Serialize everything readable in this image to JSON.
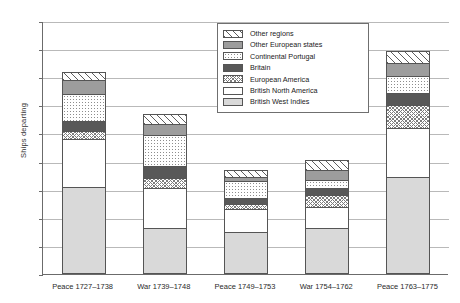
{
  "chart_data": {
    "type": "bar",
    "title": "",
    "subtitle": "",
    "xlabel": "",
    "ylabel": "Ships departing",
    "ylim": [
      0,
      180
    ],
    "ytick_step": 20,
    "yticks": [
      0,
      20,
      40,
      60,
      80,
      100,
      120,
      140,
      160,
      180
    ],
    "grid": true,
    "stacked": true,
    "legend_position": "top-center",
    "categories": [
      "Peace 1727–1738",
      "War 1739–1748",
      "Peace 1749–1753",
      "War 1754–1762",
      "Peace 1763–1775"
    ],
    "series": [
      {
        "name": "British West Indies",
        "values": [
          62,
          33,
          30,
          33,
          69
        ]
      },
      {
        "name": "British North America",
        "values": [
          34,
          28,
          16,
          15,
          35
        ]
      },
      {
        "name": "European America",
        "values": [
          6,
          7,
          4,
          8,
          16
        ]
      },
      {
        "name": "Britain",
        "values": [
          7,
          9,
          4,
          5,
          9
        ]
      },
      {
        "name": "Continental Portugal",
        "values": [
          19,
          22,
          12,
          6,
          12
        ]
      },
      {
        "name": "Other European states",
        "values": [
          10,
          8,
          3,
          7,
          9
        ]
      },
      {
        "name": "Other regions",
        "values": [
          6,
          7,
          5,
          7,
          9
        ]
      }
    ],
    "series_colors": {
      "British West Indies": "#d9d9d9",
      "British North America": "#ffffff",
      "European America": "#ffffff",
      "Britain": "#585858",
      "Continental Portugal": "#ffffff",
      "Other European states": "#9d9d9d",
      "Other regions": "#ffffff"
    },
    "series_patterns": {
      "British West Indies": "solid-light-gray",
      "British North America": "solid-white",
      "European America": "fine-crosshatch",
      "Britain": "solid-dark-gray",
      "Continental Portugal": "fine-dots",
      "Other European states": "solid-mid-gray",
      "Other regions": "diagonal-hatch"
    },
    "bar_totals": [
      144,
      114,
      74,
      81,
      159
    ],
    "legend_order": [
      "Other regions",
      "Other European states",
      "Continental Portugal",
      "Britain",
      "European America",
      "British North America",
      "British West Indies"
    ]
  }
}
